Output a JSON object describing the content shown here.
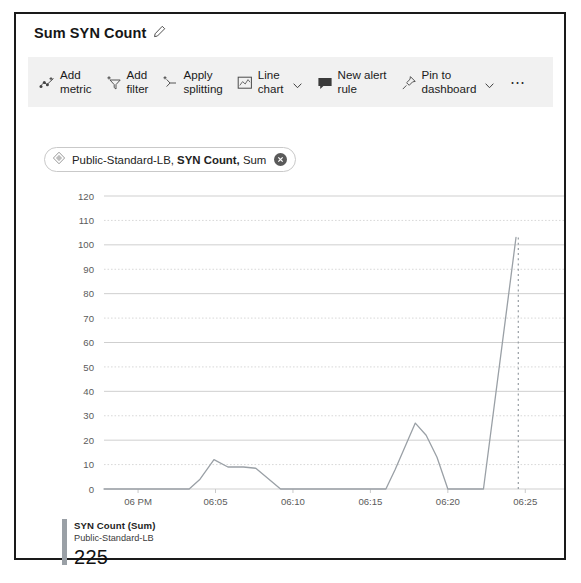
{
  "card": {
    "title": "Sum SYN Count",
    "edit_icon": "pencil-icon"
  },
  "toolbar": {
    "items": [
      {
        "label": "Add\nmetric",
        "icon": "add-metric-icon",
        "chevron": false
      },
      {
        "label": "Add\nfilter",
        "icon": "add-filter-icon",
        "chevron": false
      },
      {
        "label": "Apply\nsplitting",
        "icon": "apply-splitting-icon",
        "chevron": false
      },
      {
        "label": "Line\nchart",
        "icon": "line-chart-icon",
        "chevron": true
      },
      {
        "label": "New alert\nrule",
        "icon": "new-alert-rule-icon",
        "chevron": false
      },
      {
        "label": "Pin to\ndashboard",
        "icon": "pin-icon",
        "chevron": true
      }
    ],
    "overflow_label": "⋯"
  },
  "metric_chip": {
    "resource": "Public-Standard-LB,",
    "metric": "SYN Count,",
    "aggregation": "Sum",
    "resource_icon": "resource-icon",
    "close_icon": "close-icon"
  },
  "legend": {
    "series_name": "SYN Count (Sum)",
    "resource_name": "Public-Standard-LB",
    "value": "225",
    "color": "#9aa0a6"
  },
  "chart_data": {
    "type": "line",
    "title": "Sum SYN Count",
    "xlabel": "",
    "ylabel": "",
    "ylim": [
      0,
      120
    ],
    "yticks": [
      0,
      10,
      20,
      30,
      40,
      50,
      60,
      70,
      80,
      90,
      100,
      110,
      120
    ],
    "ytick_labels": [
      "0",
      "10",
      "20",
      "30",
      "40",
      "50",
      "60",
      "70",
      "80",
      "90",
      "100",
      "110",
      "120"
    ],
    "xticks": [
      "06 PM",
      "06:05",
      "06:10",
      "06:15",
      "06:20",
      "06:25"
    ],
    "xtick_minutes": [
      0,
      5,
      10,
      15,
      20,
      25
    ],
    "xlim_minutes": [
      -2.2,
      27.5
    ],
    "grid": true,
    "legend_position": "below",
    "line_color": "#9aa0a6",
    "series": [
      {
        "name": "SYN Count (Sum)",
        "resource": "Public-Standard-LB",
        "points": [
          {
            "t": -2.2,
            "v": 0
          },
          {
            "t": 3.3,
            "v": 0
          },
          {
            "t": 4.0,
            "v": 4
          },
          {
            "t": 4.9,
            "v": 12
          },
          {
            "t": 5.8,
            "v": 9
          },
          {
            "t": 6.8,
            "v": 9
          },
          {
            "t": 7.6,
            "v": 8.5
          },
          {
            "t": 9.2,
            "v": 0
          },
          {
            "t": 16.0,
            "v": 0
          },
          {
            "t": 16.6,
            "v": 8
          },
          {
            "t": 17.9,
            "v": 27
          },
          {
            "t": 18.6,
            "v": 22
          },
          {
            "t": 19.3,
            "v": 13
          },
          {
            "t": 20.0,
            "v": 0
          },
          {
            "t": 22.3,
            "v": 0
          },
          {
            "t": 24.4,
            "v": 103
          }
        ]
      }
    ],
    "annotations": [
      {
        "type": "dotted-vertical",
        "note": "partial/incomplete last data point marker",
        "t": 24.55,
        "v_from": 103,
        "v_to": 0
      }
    ]
  }
}
